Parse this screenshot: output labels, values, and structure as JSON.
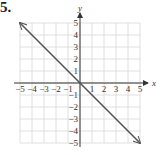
{
  "problem": {
    "number": "5."
  },
  "chart_data": {
    "type": "line",
    "title": "",
    "xlabel": "x",
    "ylabel": "y",
    "xlim": [
      -5,
      5
    ],
    "ylim": [
      -5,
      5
    ],
    "grid": true,
    "x_ticks": [
      "-5",
      "-4",
      "-3",
      "-2",
      "-1",
      "1",
      "2",
      "3",
      "4",
      "5"
    ],
    "y_ticks": [
      "5",
      "4",
      "3",
      "2",
      "1",
      "-1",
      "-2",
      "-3",
      "-4",
      "-5"
    ],
    "series": [
      {
        "name": "line",
        "x": [
          -5,
          5
        ],
        "y": [
          5,
          -5
        ],
        "arrows": "both"
      }
    ],
    "colors": {
      "line": "#555555",
      "grid": "#d8d8d8",
      "axis": "#333333"
    }
  }
}
